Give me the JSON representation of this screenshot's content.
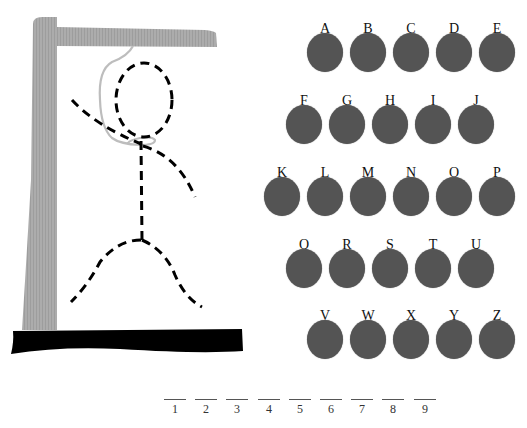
{
  "game": {
    "title": "Hangman",
    "colors": {
      "gallows_wood": "#a9a9a9",
      "gallows_base": "#000000",
      "rope": "#bdbdbd",
      "figure": "#000000",
      "letter_disc": "#545454",
      "letter_text": "#111111"
    },
    "gallows": {
      "parts": [
        "post",
        "beam",
        "base",
        "rope"
      ]
    },
    "figure": {
      "parts_drawn": [
        "head",
        "body",
        "left-arm",
        "right-arm",
        "left-leg",
        "right-leg"
      ]
    },
    "letter_rows": [
      {
        "x": 307,
        "y": 22,
        "letters": [
          "A",
          "B",
          "C",
          "D",
          "E"
        ]
      },
      {
        "x": 286,
        "y": 94,
        "letters": [
          "F",
          "G",
          "H",
          "I",
          "J"
        ]
      },
      {
        "x": 264,
        "y": 166,
        "letters": [
          "K",
          "L",
          "M",
          "N",
          "O",
          "P"
        ]
      },
      {
        "x": 286,
        "y": 238,
        "letters": [
          "Q",
          "R",
          "S",
          "T",
          "U"
        ]
      },
      {
        "x": 307,
        "y": 309,
        "letters": [
          "V",
          "W",
          "X",
          "Y",
          "Z"
        ]
      }
    ],
    "letter_spacing": 43,
    "word_slots": [
      {
        "index": "1",
        "letter": ""
      },
      {
        "index": "2",
        "letter": ""
      },
      {
        "index": "3",
        "letter": ""
      },
      {
        "index": "4",
        "letter": ""
      },
      {
        "index": "5",
        "letter": ""
      },
      {
        "index": "6",
        "letter": ""
      },
      {
        "index": "7",
        "letter": ""
      },
      {
        "index": "8",
        "letter": ""
      },
      {
        "index": "9",
        "letter": ""
      }
    ],
    "slot_start_x": 164,
    "slot_spacing": 31.2
  }
}
